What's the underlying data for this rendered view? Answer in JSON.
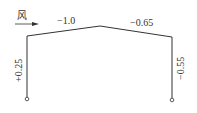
{
  "diagram": {
    "type": "portal-frame-wind-load",
    "wind_label": "风",
    "coefficients": {
      "left_roof": "−1.0",
      "right_roof": "−0.65",
      "left_column": "+0.25",
      "right_column": "−0.55"
    },
    "colors": {
      "line": "#333333",
      "background": "#ffffff"
    }
  }
}
